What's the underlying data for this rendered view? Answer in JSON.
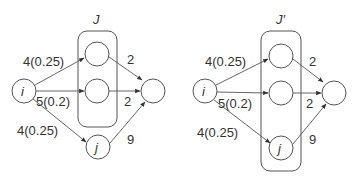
{
  "diagrams": [
    {
      "box_label": "J",
      "nodes": {
        "source": "i",
        "top": "",
        "middle": "",
        "bottom": "j",
        "sink": ""
      },
      "edges": {
        "to_top": "4(0.25)",
        "to_middle": "5(0.2)",
        "to_bottom": "4(0.25)",
        "top_to_sink": "2",
        "middle_to_sink": "2",
        "bottom_to_sink": "9"
      }
    },
    {
      "box_label": "J′",
      "nodes": {
        "source": "i",
        "top": "",
        "middle": "",
        "bottom": "j",
        "sink": ""
      },
      "edges": {
        "to_top": "4(0.25)",
        "to_middle": "5(0.2)",
        "to_bottom": "4(0.25)",
        "top_to_sink": "2",
        "middle_to_sink": "2",
        "bottom_to_sink": "9"
      }
    }
  ]
}
